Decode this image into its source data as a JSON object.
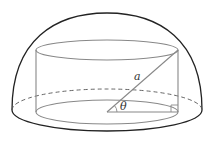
{
  "diagram": {
    "labels": {
      "hypotenuse": "a",
      "angle": "θ"
    },
    "colors": {
      "hemisphere_stroke": "#222222",
      "cylinder_stroke": "#888888",
      "background": "#ffffff"
    }
  }
}
